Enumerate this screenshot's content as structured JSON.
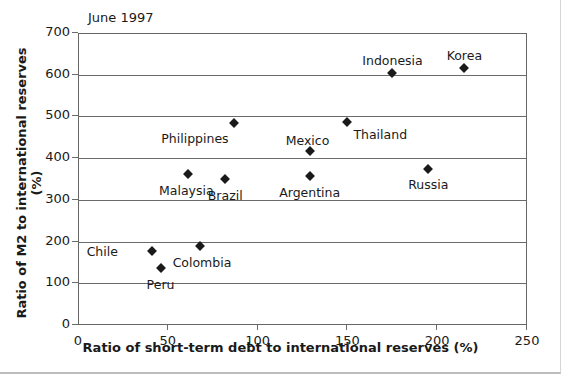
{
  "chart_data": {
    "type": "scatter",
    "title": "",
    "annotation": "June 1997",
    "xlabel": "Ratio of short-term debt to international reserves (%)",
    "ylabel": "Ratio of M2 to international reserves (%)",
    "xlim": [
      0,
      250
    ],
    "ylim": [
      0,
      700
    ],
    "xticks": [
      0,
      50,
      100,
      150,
      200,
      250
    ],
    "yticks": [
      0,
      100,
      200,
      300,
      400,
      500,
      600,
      700
    ],
    "xtick_labels": [
      "0",
      "50",
      "100",
      "150",
      "200",
      "250"
    ],
    "ytick_labels": [
      "0",
      "100",
      "200",
      "300",
      "400",
      "500",
      "600",
      "700"
    ],
    "grid": "horizontal",
    "legend": "none",
    "marker_shape": "diamond",
    "marker_color": "#1a1a1a",
    "points": [
      {
        "name": "Chile",
        "x": 41,
        "y": 178,
        "label_dx": -34,
        "label_dy": 1,
        "label_anchor": "right"
      },
      {
        "name": "Peru",
        "x": 46,
        "y": 137,
        "label_dx": 0,
        "label_dy": 17,
        "label_anchor": "center"
      },
      {
        "name": "Colombia",
        "x": 68,
        "y": 190,
        "label_dx": 2,
        "label_dy": 17,
        "label_anchor": "center"
      },
      {
        "name": "Malaysia",
        "x": 61,
        "y": 363,
        "label_dx": -1,
        "label_dy": 17,
        "label_anchor": "center"
      },
      {
        "name": "Brazil",
        "x": 82,
        "y": 351,
        "label_dx": 0,
        "label_dy": 17,
        "label_anchor": "center"
      },
      {
        "name": "Philippines",
        "x": 87,
        "y": 484,
        "label_dx": -6,
        "label_dy": 16,
        "label_anchor": "right"
      },
      {
        "name": "Mexico",
        "x": 129,
        "y": 418,
        "label_dx": -2,
        "label_dy": -10,
        "label_anchor": "center"
      },
      {
        "name": "Argentina",
        "x": 129,
        "y": 357,
        "label_dx": 0,
        "label_dy": 17,
        "label_anchor": "center"
      },
      {
        "name": "Thailand",
        "x": 150,
        "y": 487,
        "label_dx": 6,
        "label_dy": 13,
        "label_anchor": "left"
      },
      {
        "name": "Indonesia",
        "x": 175,
        "y": 605,
        "label_dx": 0,
        "label_dy": -12,
        "label_anchor": "center"
      },
      {
        "name": "Russia",
        "x": 195,
        "y": 375,
        "label_dx": 0,
        "label_dy": 16,
        "label_anchor": "center"
      },
      {
        "name": "Korea",
        "x": 215,
        "y": 617,
        "label_dx": 0,
        "label_dy": -12,
        "label_anchor": "center"
      }
    ]
  }
}
